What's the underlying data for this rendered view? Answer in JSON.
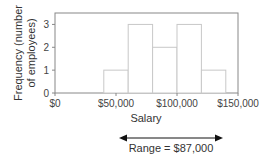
{
  "chart_data": {
    "type": "bar",
    "subtype": "histogram",
    "title": "",
    "xlabel": "Salary",
    "ylabel": "Frequency (number of employees)",
    "ylabel_lines": [
      "Frequency (number",
      "of employees)"
    ],
    "bins": [
      {
        "from": 40000,
        "to": 60000,
        "count": 1
      },
      {
        "from": 60000,
        "to": 80000,
        "count": 3
      },
      {
        "from": 80000,
        "to": 100000,
        "count": 2
      },
      {
        "from": 100000,
        "to": 120000,
        "count": 3
      },
      {
        "from": 120000,
        "to": 140000,
        "count": 1
      }
    ],
    "categories": [
      "$40,000–$60,000",
      "$60,000–$80,000",
      "$80,000–$100,000",
      "$100,000–$120,000",
      "$120,000–$140,000"
    ],
    "values": [
      1,
      3,
      2,
      3,
      1
    ],
    "xlim": [
      0,
      150000
    ],
    "ylim": [
      0,
      3.5
    ],
    "x_ticks": [
      0,
      50000,
      100000,
      150000
    ],
    "x_tick_labels": [
      "$0",
      "$50,000",
      "$100,000",
      "$150,000"
    ],
    "y_ticks": [
      0,
      1,
      2,
      3
    ],
    "y_tick_labels": [
      "0",
      "1",
      "2",
      "3"
    ],
    "grid": false,
    "legend": null,
    "annotations": [
      {
        "type": "double-arrow",
        "text": "Range = $87,000"
      }
    ]
  },
  "annotation": {
    "range_label": "Range = $87,000"
  },
  "colors": {
    "bar_fill": "#ffffff",
    "bar_stroke": "#c8c8c8",
    "axis": "#888888",
    "frame": "#888888",
    "arrow": "#111111"
  }
}
